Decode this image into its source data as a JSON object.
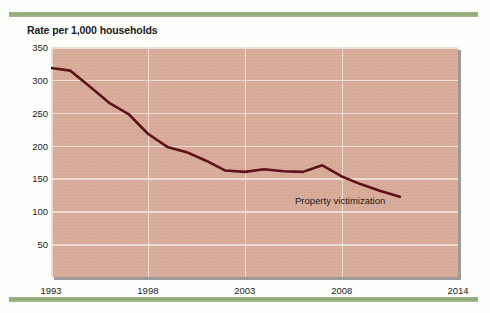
{
  "figure": {
    "background_color": "#fdfdfc",
    "rule_color": "#8ca874",
    "plot_background_color": "#d9ab99",
    "gridline_color": "#f2e4dd",
    "line_color": "#5c1218"
  },
  "chart_data": {
    "type": "line",
    "title": "Rate per 1,000 households",
    "xlabel": "",
    "ylabel": "Rate per 1,000 households",
    "xlim": [
      1993,
      2014
    ],
    "ylim": [
      0,
      350
    ],
    "grid": true,
    "legend_position": "inline-annotation",
    "y_ticks": [
      50,
      100,
      150,
      200,
      250,
      300,
      350
    ],
    "y_tick_labels": [
      "50",
      "100",
      "150",
      "200",
      "250",
      "300",
      "350"
    ],
    "x_ticks": [
      1993,
      1998,
      2003,
      2008,
      2014
    ],
    "x_tick_labels": [
      "1993",
      "1998",
      "2003",
      "2008",
      "2014"
    ],
    "series": [
      {
        "name": "Property victimization",
        "color": "#5c1218",
        "annotation": "Property victimization",
        "x": [
          1993,
          1994,
          1995,
          1996,
          1997,
          1998,
          1999,
          2000,
          2001,
          2002,
          2003,
          2004,
          2005,
          2006,
          2007,
          2008,
          2009,
          2010,
          2011
        ],
        "values": [
          318,
          314,
          290,
          265,
          248,
          218,
          198,
          190,
          177,
          162,
          160,
          164,
          161,
          160,
          170,
          153,
          141,
          131,
          122
        ]
      }
    ]
  }
}
